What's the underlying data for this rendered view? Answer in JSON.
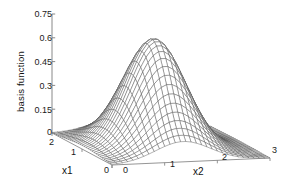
{
  "figure": {
    "kind": "3d-mesh-surface-plot",
    "background_color": "#ffffff",
    "mesh_color": "#4a4a4a",
    "axis_color": "#7a7a7a",
    "text_color": "#1a1a1a"
  },
  "axes": {
    "z": {
      "label": "basis function",
      "ticks": [
        "0.75",
        "0.6",
        "0.45",
        "0.3",
        "0.15",
        "0"
      ],
      "tick_values": [
        0.75,
        0.6,
        0.45,
        0.3,
        0.15,
        0
      ],
      "range": [
        0,
        0.75
      ]
    },
    "x1": {
      "label": "x1",
      "ticks": [
        "2",
        "1",
        "0"
      ],
      "tick_values": [
        2,
        1,
        0
      ],
      "range": [
        0,
        2
      ]
    },
    "x2": {
      "label": "x2",
      "ticks": [
        "0",
        "1",
        "2",
        "3"
      ],
      "tick_values": [
        0,
        1,
        2,
        3
      ],
      "range": [
        0,
        3
      ]
    }
  },
  "chart_data": {
    "type": "surface",
    "title": "",
    "xlabel": "x1",
    "ylabel": "x2",
    "zlabel": "basis function",
    "xlim": [
      0,
      2
    ],
    "ylim": [
      0,
      3
    ],
    "zlim": [
      0,
      0.75
    ],
    "grid": false,
    "legend": null,
    "mesh": {
      "nx": 31,
      "ny": 31,
      "line_color": "#4a4a4a",
      "face_color": "#ffffff"
    },
    "function": {
      "form": "gaussian_radial_basis",
      "expression": "z = A * exp(-((x1-c1)^2 + (x2-c2)^2) / (2*s^2))",
      "amplitude": 0.68,
      "center_x1": 0.95,
      "center_x2": 1.35,
      "sigma": 0.52,
      "peak_value": 0.68
    },
    "view": {
      "azimuth_deg": -37.5,
      "elevation_deg": 30
    },
    "samples": [
      {
        "x1": 0.0,
        "x2": 0.0,
        "z": 0.02
      },
      {
        "x1": 0.0,
        "x2": 1.5,
        "z": 0.11
      },
      {
        "x1": 0.0,
        "x2": 3.0,
        "z": 0.01
      },
      {
        "x1": 1.0,
        "x2": 0.0,
        "z": 0.11
      },
      {
        "x1": 1.0,
        "x2": 1.0,
        "z": 0.58
      },
      {
        "x1": 1.0,
        "x2": 1.35,
        "z": 0.68
      },
      {
        "x1": 1.0,
        "x2": 2.0,
        "z": 0.43
      },
      {
        "x1": 1.0,
        "x2": 3.0,
        "z": 0.04
      },
      {
        "x1": 2.0,
        "x2": 0.0,
        "z": 0.02
      },
      {
        "x1": 2.0,
        "x2": 1.5,
        "z": 0.11
      },
      {
        "x1": 2.0,
        "x2": 3.0,
        "z": 0.01
      }
    ]
  }
}
